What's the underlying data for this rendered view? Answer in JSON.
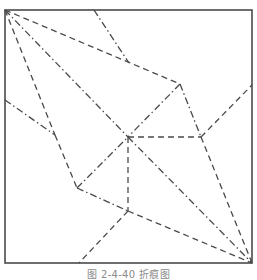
{
  "caption": "图 2-4-40  折痕图",
  "colors": {
    "border": "#4a4a4a",
    "line": "#4a4a4a",
    "caption": "#8a8a8a",
    "background": "#ffffff"
  },
  "diagram": {
    "type": "origami crease pattern",
    "square": {
      "x1": 5,
      "y1": 10,
      "x2": 252,
      "y2": 263
    },
    "legend_styles": {
      "dashed": "valley fold (dashed)",
      "dash-dot": "mountain fold (dash-dot)"
    },
    "lines": [
      {
        "style": "dashed",
        "from": [
          5,
          10
        ],
        "to": [
          180,
          84
        ]
      },
      {
        "style": "dash-dot",
        "from": [
          5,
          10
        ],
        "to": [
          128,
          137
        ]
      },
      {
        "style": "dashed",
        "from": [
          5,
          10
        ],
        "to": [
          55,
          135
        ]
      },
      {
        "style": "dash-dot",
        "from": [
          94,
          10
        ],
        "to": [
          129,
          63
        ]
      },
      {
        "style": "dash-dot",
        "from": [
          180,
          84
        ],
        "to": [
          201,
          137
        ]
      },
      {
        "style": "dash-dot",
        "from": [
          180,
          84
        ],
        "to": [
          128,
          137
        ]
      },
      {
        "style": "dashed",
        "from": [
          201,
          137
        ],
        "to": [
          252,
          85
        ]
      },
      {
        "style": "dashed",
        "from": [
          128,
          137
        ],
        "to": [
          201,
          137
        ]
      },
      {
        "style": "dash-dot",
        "from": [
          5,
          100
        ],
        "to": [
          55,
          135
        ]
      },
      {
        "style": "dashed",
        "from": [
          55,
          135
        ],
        "to": [
          77,
          188
        ]
      },
      {
        "style": "dash-dot",
        "from": [
          77,
          188
        ],
        "to": [
          128,
          137
        ]
      },
      {
        "style": "dash-dot",
        "from": [
          77,
          188
        ],
        "to": [
          128,
          211
        ]
      },
      {
        "style": "dashed",
        "from": [
          128,
          137
        ],
        "to": [
          128,
          211
        ]
      },
      {
        "style": "dashed",
        "from": [
          128,
          211
        ],
        "to": [
          79,
          263
        ]
      },
      {
        "style": "dash-dot",
        "from": [
          128,
          137
        ],
        "to": [
          252,
          263
        ]
      },
      {
        "style": "dashed",
        "from": [
          201,
          137
        ],
        "to": [
          252,
          263
        ]
      },
      {
        "style": "dashed",
        "from": [
          128,
          211
        ],
        "to": [
          252,
          263
        ]
      }
    ]
  }
}
